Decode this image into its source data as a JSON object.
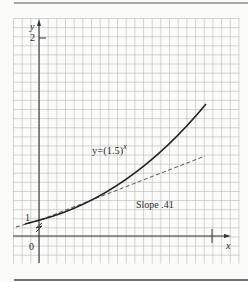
{
  "chart_data": {
    "type": "line",
    "title": "",
    "xlabel": "x",
    "ylabel": "y",
    "x_ticks": [
      "0",
      "1"
    ],
    "y_ticks": [
      "1",
      "2"
    ],
    "grid": true,
    "y_axis_break": true,
    "series": [
      {
        "name": "y=(1.5)^x",
        "style": "solid",
        "x": [
          -0.15,
          0,
          0.2,
          0.4,
          0.6,
          0.8,
          0.97
        ],
        "y": [
          0.94,
          1.0,
          1.084,
          1.176,
          1.275,
          1.383,
          1.482
        ]
      },
      {
        "name": "Slope .41",
        "style": "dashed",
        "x": [
          -0.15,
          0,
          0.2,
          0.4,
          0.6,
          0.8,
          0.97
        ],
        "y": [
          0.938,
          1.0,
          1.082,
          1.164,
          1.246,
          1.328,
          1.398
        ]
      }
    ],
    "annotations": [
      {
        "text": "y=(1.5)",
        "superscript": "x",
        "target": "curve"
      },
      {
        "text": "Slope .41",
        "target": "tangent line"
      }
    ]
  },
  "labels": {
    "y_axis": "y",
    "x_axis": "x",
    "y_two": "2",
    "y_one": "1",
    "origin": "0",
    "x_one": "1",
    "curve_base": "y=(1.5)",
    "curve_exp": "x",
    "slope": "Slope .41"
  }
}
